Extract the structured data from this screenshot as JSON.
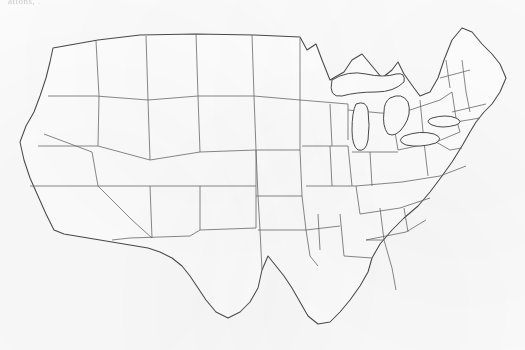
{
  "figure": {
    "caption_top": "ations, .",
    "kind": "thematic-map",
    "region": "United States (contiguous 48 states)",
    "shading_style": "stipple",
    "colors": {
      "paper": "#fcfcfc",
      "outline": "#4a4a4a",
      "state_border": "#6b6b6b",
      "stipple": "#2e2e2e"
    }
  },
  "legend": {
    "shaded_meaning": "shaded (stippled) area",
    "unshaded_meaning": "unshaded area"
  },
  "map_data": {
    "type": "choropleth-stipple",
    "title": "",
    "shaded_regions": [
      {
        "name": "north-cascades-washington",
        "state": "WA",
        "shaded": true
      },
      {
        "name": "olympic-peninsula",
        "state": "WA",
        "shaded": true
      },
      {
        "name": "blue-mountains-oregon",
        "state": "OR",
        "shaded": true
      },
      {
        "name": "sierra-nevada",
        "state": "CA",
        "shaded": true
      },
      {
        "name": "coastal-range-california",
        "state": "CA",
        "shaded": true
      },
      {
        "name": "northern-rockies-montana",
        "state": "MT",
        "shaded": true
      },
      {
        "name": "central-idaho",
        "state": "ID",
        "shaded": true
      },
      {
        "name": "greater-yellowstone-wyoming",
        "state": "WY",
        "shaded": true
      },
      {
        "name": "wasatch-uinta-utah",
        "state": "UT",
        "shaded": true
      },
      {
        "name": "colorado-rockies",
        "state": "CO",
        "shaded": true
      },
      {
        "name": "four-corners-plateau",
        "state": "AZ/NM/UT/CO",
        "shaded": true
      },
      {
        "name": "sacramento-mountains-new-mexico",
        "state": "NM",
        "shaded": true
      },
      {
        "name": "black-hills",
        "state": "SD",
        "shaded": true
      },
      {
        "name": "nebraska-sandhills",
        "state": "NE",
        "shaded": true
      },
      {
        "name": "ozark-plateau",
        "state": "MO/AR",
        "shaded": true
      },
      {
        "name": "southern-illinois-indiana",
        "state": "IL/IN",
        "shaded": true
      },
      {
        "name": "kentucky-tennessee-highlands",
        "state": "KY/TN",
        "shaded": true
      },
      {
        "name": "lower-michigan",
        "state": "MI",
        "shaded": true
      },
      {
        "name": "northern-minnesota",
        "state": "MN",
        "shaded": true
      },
      {
        "name": "appalachian-ridge-valley",
        "state": "PA/MD/WV/VA",
        "shaded": true
      },
      {
        "name": "blue-ridge",
        "state": "VA/NC",
        "shaded": true
      },
      {
        "name": "hudson-adirondack",
        "state": "NY",
        "shaded": true
      },
      {
        "name": "southern-new-england",
        "state": "CT/RI/MA",
        "shaded": true
      },
      {
        "name": "edwards-plateau-texas",
        "state": "TX",
        "shaded": true
      },
      {
        "name": "west-texas-patch",
        "state": "TX",
        "shaded": true
      },
      {
        "name": "south-texas-patch",
        "state": "TX",
        "shaded": true
      },
      {
        "name": "louisiana-patch",
        "state": "LA",
        "shaded": true
      },
      {
        "name": "alabama-patch",
        "state": "AL",
        "shaded": true
      },
      {
        "name": "carolina-sandhills",
        "state": "NC/SC",
        "shaded": true
      },
      {
        "name": "ohio-patch",
        "state": "OH",
        "shaded": true
      }
    ],
    "unshaded_notable": [
      "Florida peninsula",
      "Great Plains (KS, OK, ND)",
      "Great Basin (NV)",
      "Northern New England (ME, NH, VT)",
      "Gulf coastal plain"
    ]
  }
}
